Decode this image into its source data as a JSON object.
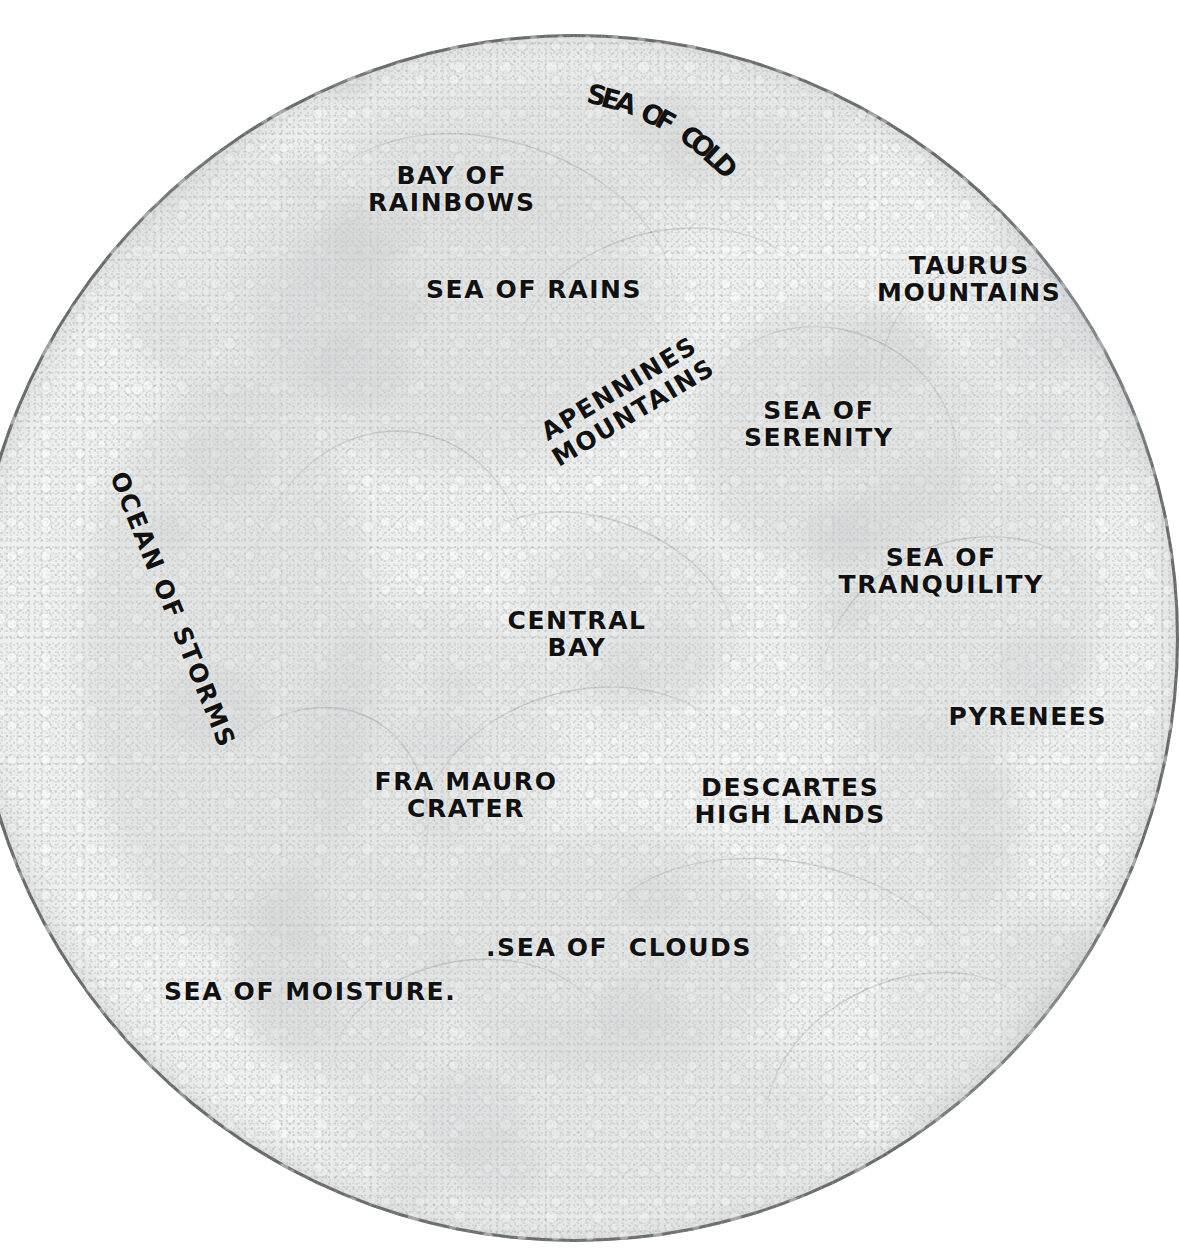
{
  "map": {
    "title": "Lunar Near Side Map",
    "subject": "moon",
    "background_color": "#ffffff",
    "disc_color": "#eef0ef",
    "rim_color": "#5a5d5e",
    "label_color": "#111111",
    "mare_color": "#c8cbcb",
    "disc": {
      "center_x": 575,
      "center_y": 638,
      "radius": 604,
      "cropped_edge": "right"
    }
  },
  "labels": [
    {
      "id": "sea-of-cold",
      "text": "SEA OF COLD",
      "lines": [
        "SEA OF COLD"
      ],
      "x": 620,
      "y": 118,
      "rotation": 28,
      "size": 27,
      "style": "arc"
    },
    {
      "id": "bay-of-rainbows",
      "text": "BAY OF RAINBOWS",
      "lines": [
        "BAY OF",
        "RAINBOWS"
      ],
      "x": 452,
      "y": 189,
      "rotation": 0,
      "size": 25,
      "style": "block"
    },
    {
      "id": "sea-of-rains",
      "text": "SEA OF RAINS",
      "lines": [
        "SEA OF RAINS"
      ],
      "x": 534,
      "y": 290,
      "rotation": 0,
      "size": 25,
      "style": "block"
    },
    {
      "id": "taurus-mountains",
      "text": "TAURUS MOUNTAINS",
      "lines": [
        "TAURUS",
        "MOUNTAINS"
      ],
      "x": 969,
      "y": 279,
      "rotation": 0,
      "size": 25,
      "style": "block"
    },
    {
      "id": "apennines-mountains",
      "text": "APENNINES MOUNTAINS",
      "lines": [
        "APENNINES",
        "MOUNTAINS"
      ],
      "x": 626,
      "y": 400,
      "rotation": -31,
      "size": 25,
      "style": "block"
    },
    {
      "id": "sea-of-serenity",
      "text": "SEA OF SERENITY",
      "lines": [
        "SEA OF",
        "SERENITY"
      ],
      "x": 819,
      "y": 424,
      "rotation": 0,
      "size": 25,
      "style": "block"
    },
    {
      "id": "ocean-of-storms",
      "text": "OCEAN OF STORMS",
      "lines": [
        "OCEAN OF STORMS"
      ],
      "x": 172,
      "y": 610,
      "rotation": 68,
      "size": 25,
      "style": "block"
    },
    {
      "id": "sea-of-tranquility",
      "text": "SEA OF TRANQUILITY",
      "lines": [
        "SEA OF",
        "TRANQUILITY"
      ],
      "x": 941,
      "y": 571,
      "rotation": 0,
      "size": 25,
      "style": "block"
    },
    {
      "id": "central-bay",
      "text": "CENTRAL BAY",
      "lines": [
        "CENTRAL",
        "BAY"
      ],
      "x": 577,
      "y": 634,
      "rotation": 0,
      "size": 25,
      "style": "block"
    },
    {
      "id": "pyrenees",
      "text": "PYRENEES",
      "lines": [
        "PYRENEES"
      ],
      "x": 1028,
      "y": 717,
      "rotation": 0,
      "size": 25,
      "style": "block"
    },
    {
      "id": "fra-mauro-crater",
      "text": "FRA MAURO CRATER",
      "lines": [
        "FRA MAURO",
        "CRATER"
      ],
      "x": 466,
      "y": 795,
      "rotation": 0,
      "size": 25,
      "style": "block"
    },
    {
      "id": "descartes-highlands",
      "text": "DESCARTES HIGHLANDS",
      "lines": [
        "DESCARTES",
        "HIGH LANDS"
      ],
      "x": 790,
      "y": 801,
      "rotation": 0,
      "size": 25,
      "style": "block"
    },
    {
      "id": "sea-of-clouds",
      "text": "SEA OF CLOUDS",
      "lines": [
        ".SEA OF  CLOUDS"
      ],
      "x": 619,
      "y": 948,
      "rotation": 0,
      "size": 25,
      "style": "block"
    },
    {
      "id": "sea-of-moisture",
      "text": "SEA OF MOISTURE",
      "lines": [
        "SEA OF MOISTURE."
      ],
      "x": 310,
      "y": 992,
      "rotation": 0,
      "size": 25,
      "style": "block"
    }
  ],
  "arc_labels": {
    "sea-of-cold": {
      "chars": [
        "S",
        "E",
        "A",
        " ",
        "O",
        "F",
        " ",
        "C",
        "O",
        "L",
        "D"
      ],
      "start_angle": 12,
      "end_angle": 46,
      "radius": 250,
      "center_x": 545,
      "center_y": 340
    }
  },
  "mare_regions": [
    {
      "id": "mare-frigoris",
      "x": 330,
      "y": 70,
      "w": 520,
      "h": 150,
      "opacity": 0.3
    },
    {
      "id": "mare-imbrium",
      "x": 250,
      "y": 170,
      "w": 420,
      "h": 300,
      "opacity": 0.34
    },
    {
      "id": "mare-serenitatis",
      "x": 690,
      "y": 300,
      "w": 290,
      "h": 270,
      "opacity": 0.3
    },
    {
      "id": "mare-tranquilitatis",
      "x": 800,
      "y": 460,
      "w": 300,
      "h": 300,
      "opacity": 0.26
    },
    {
      "id": "oceanus-procellarum",
      "x": 80,
      "y": 380,
      "w": 300,
      "h": 560,
      "opacity": 0.32
    },
    {
      "id": "mare-nubium",
      "x": 430,
      "y": 830,
      "w": 360,
      "h": 240,
      "opacity": 0.3
    },
    {
      "id": "mare-humorum",
      "x": 230,
      "y": 860,
      "w": 220,
      "h": 220,
      "opacity": 0.28
    },
    {
      "id": "mare-vaporum",
      "x": 520,
      "y": 520,
      "w": 220,
      "h": 200,
      "opacity": 0.22
    },
    {
      "id": "mare-nectaris",
      "x": 820,
      "y": 720,
      "w": 200,
      "h": 210,
      "opacity": 0.22
    },
    {
      "id": "south-highland",
      "x": 330,
      "y": 1020,
      "w": 520,
      "h": 200,
      "opacity": 0.26
    },
    {
      "id": "copernicus-region",
      "x": 300,
      "y": 600,
      "w": 260,
      "h": 300,
      "opacity": 0.24
    },
    {
      "id": "northwest-limb",
      "x": 120,
      "y": 150,
      "w": 260,
      "h": 260,
      "opacity": 0.2
    },
    {
      "id": "east-limb",
      "x": 960,
      "y": 200,
      "w": 220,
      "h": 300,
      "opacity": 0.18
    },
    {
      "id": "southeast-limb",
      "x": 880,
      "y": 900,
      "w": 260,
      "h": 280,
      "opacity": 0.2
    }
  ]
}
